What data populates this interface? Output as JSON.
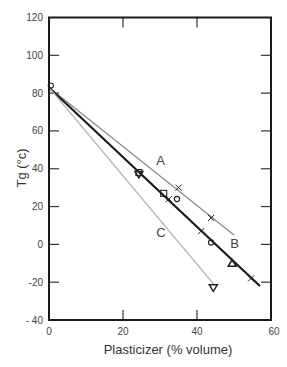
{
  "chart_data": {
    "type": "line",
    "title": "",
    "xlabel": "Plasticizer (% volume)",
    "ylabel": "Tg (°c)",
    "xlim": [
      0,
      60
    ],
    "ylim": [
      -40,
      120
    ],
    "xticks": [
      0,
      20,
      40,
      60
    ],
    "yticks": [
      -40,
      -20,
      0,
      20,
      40,
      60,
      80,
      100,
      120
    ],
    "ytick_labels": [
      "- 40",
      "-20",
      "0",
      "20",
      "40",
      "60",
      "80",
      "100",
      "120"
    ],
    "grid": false,
    "legend": null,
    "lines": [
      {
        "name": "A",
        "color": "#8a8a8a",
        "width": 1.3,
        "x": [
          0,
          50
        ],
        "y": [
          83,
          5
        ],
        "label_pos": [
          29,
          42
        ]
      },
      {
        "name": "B",
        "color": "#1a1a1a",
        "width": 2.2,
        "x": [
          0,
          57
        ],
        "y": [
          83,
          -22
        ],
        "label_pos": [
          49,
          -2
        ]
      },
      {
        "name": "C",
        "color": "#b0b0b0",
        "width": 1.3,
        "x": [
          0,
          44.5
        ],
        "y": [
          83,
          -21
        ],
        "label_pos": [
          29,
          4
        ]
      }
    ],
    "points": [
      {
        "marker": "circle",
        "x": 0.5,
        "y": 84
      },
      {
        "marker": "square",
        "x": 24.3,
        "y": 38
      },
      {
        "marker": "triangle-down",
        "x": 24.3,
        "y": 37
      },
      {
        "marker": "square",
        "x": 31,
        "y": 27
      },
      {
        "marker": "x",
        "x": 32.4,
        "y": 24
      },
      {
        "marker": "circle",
        "x": 34.6,
        "y": 24
      },
      {
        "marker": "x",
        "x": 35,
        "y": 30
      },
      {
        "marker": "x",
        "x": 43.8,
        "y": 14
      },
      {
        "marker": "x",
        "x": 41.1,
        "y": 7
      },
      {
        "marker": "circle",
        "x": 43.8,
        "y": 1
      },
      {
        "marker": "triangle-up",
        "x": 49.5,
        "y": -10
      },
      {
        "marker": "x",
        "x": 54.6,
        "y": -18
      },
      {
        "marker": "triangle-down",
        "x": 44.4,
        "y": -23
      }
    ]
  }
}
